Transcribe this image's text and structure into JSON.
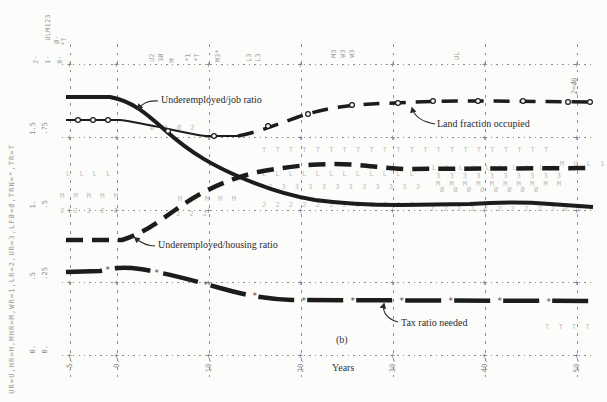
{
  "figure": {
    "panel_label": "(b)",
    "x_axis_label": "Years",
    "corner_note": "2=46",
    "left_legend": "UR=U,HR=H,MHR=M,WR=1,LR=2,UR=3,LFØ=Ø,TRN=*,TR=T",
    "corner_scale_symbols": [
      {
        "text": "ULM123",
        "x": 44,
        "yb": 40
      },
      {
        "text": "Ø·",
        "x": 53,
        "yb": 44
      },
      {
        "text": "*T",
        "x": 60,
        "yb": 46
      }
    ],
    "corner_scale_values": [
      {
        "text": "2·",
        "x": 32,
        "yb": 64
      },
      {
        "text": "1·",
        "x": 44,
        "yb": 64
      },
      {
        "text": "8·",
        "x": 56,
        "yb": 64
      }
    ]
  },
  "labels": {
    "underemployed_job_ratio": "Underemployed/job ratio",
    "land_fraction_occupied": "Land fraction occupied",
    "underemployed_housing_ratio": "Underemployed/housing ratio",
    "tax_ratio_needed": "Tax ratio needed"
  },
  "axes": {
    "x_ticks": [
      {
        "label": "-5.",
        "x": 70
      },
      {
        "label": "0.",
        "x": 117
      },
      {
        "label": "10.",
        "x": 209
      },
      {
        "label": "20.",
        "x": 301
      },
      {
        "label": "30.",
        "x": 393
      },
      {
        "label": "40.",
        "x": 485
      },
      {
        "label": "50.",
        "x": 577
      }
    ],
    "y_ticks": [
      {
        "scale1": "1.5",
        "scale2": ".75",
        "y": 138
      },
      {
        "scale1": "1.",
        "scale2": ".5",
        "y": 211
      },
      {
        "scale1": ".5",
        "scale2": ".25",
        "y": 283
      },
      {
        "scale1": "0.",
        "scale2": "0.",
        "y": 356
      }
    ],
    "grid_x": [
      70,
      117,
      209,
      301,
      393,
      485,
      577
    ],
    "grid_y": [
      65,
      138,
      211,
      283,
      356
    ]
  },
  "margin_notes": [
    {
      "text": "U2",
      "x": 148,
      "yb": 62
    },
    {
      "text": "3Ø",
      "x": 157,
      "yb": 62
    },
    {
      "text": "M",
      "x": 168,
      "yb": 62
    },
    {
      "text": "*1",
      "x": 184,
      "yb": 62
    },
    {
      "text": "*T",
      "x": 193,
      "yb": 62
    },
    {
      "text": "M3*",
      "x": 214,
      "yb": 62
    },
    {
      "text": "L3",
      "x": 245,
      "yb": 62
    },
    {
      "text": "L3",
      "x": 254,
      "yb": 62
    },
    {
      "text": "M3",
      "x": 330,
      "yb": 58
    },
    {
      "text": "W3",
      "x": 339,
      "yb": 58
    },
    {
      "text": "W3",
      "x": 348,
      "yb": 58
    },
    {
      "text": "UL",
      "x": 453,
      "yb": 60
    }
  ],
  "plot_symbols": {
    "letter_rows": [
      {
        "text": "L L L L",
        "x": 66,
        "y": 174
      },
      {
        "text": "M M M M M",
        "x": 60,
        "y": 196
      },
      {
        "text": "2 2 2 2 2",
        "x": 60,
        "y": 211
      },
      {
        "text": "M M M M M",
        "x": 178,
        "y": 199
      },
      {
        "text": "2 2 2",
        "x": 176,
        "y": 214
      },
      {
        "text": "Ø 2 Ø 2",
        "x": 150,
        "y": 128
      },
      {
        "text": "T T T T T T T T T T T T T T T T T T T T T T",
        "x": 262,
        "y": 150
      },
      {
        "text": "L L L L L L L L L L L L",
        "x": 262,
        "y": 174
      },
      {
        "text": "3 3 3 3 3 3 3 3 3 3 3 3",
        "x": 268,
        "y": 187
      },
      {
        "text": "2 2 2 2 2 2 2 2 2 2 2 2",
        "x": 262,
        "y": 205
      },
      {
        "text": "L L L L L L L L L L",
        "x": 432,
        "y": 168
      },
      {
        "text": "3 3 3 3 3 3 3 3 3 3",
        "x": 436,
        "y": 176
      },
      {
        "text": "M M M M M M M M M M",
        "x": 436,
        "y": 184
      },
      {
        "text": "Ø Ø Ø Ø Ø Ø Ø Ø",
        "x": 440,
        "y": 190
      },
      {
        "text": "2 2 2 2 2 2 2 2 2 2 2 2",
        "x": 430,
        "y": 209
      },
      {
        "text": "M U L 1",
        "x": 560,
        "y": 164
      },
      {
        "text": "* 2 *",
        "x": 562,
        "y": 210
      },
      {
        "text": "T T T T",
        "x": 545,
        "y": 327
      }
    ],
    "star_glyph": "*",
    "star_positions": [
      [
        108,
        269
      ],
      [
        157,
        272
      ],
      [
        206,
        284
      ],
      [
        255,
        295
      ],
      [
        304,
        300
      ],
      [
        353,
        300
      ],
      [
        402,
        300
      ],
      [
        451,
        300
      ],
      [
        500,
        300
      ],
      [
        549,
        301
      ]
    ],
    "circle_positions": [
      [
        78,
        120
      ],
      [
        93,
        120
      ],
      [
        108,
        120
      ],
      [
        168,
        131
      ],
      [
        214,
        136
      ],
      [
        268,
        126
      ],
      [
        308,
        114
      ],
      [
        352,
        105
      ],
      [
        398,
        103
      ],
      [
        433,
        101
      ],
      [
        478,
        101
      ],
      [
        523,
        101
      ],
      [
        568,
        102
      ],
      [
        590,
        102
      ]
    ]
  },
  "colors": {
    "curve": "#1c1c1c",
    "faint_letters": "#bcbcbc",
    "grid": "#909090",
    "label": "#2b2b2b",
    "tick": "#8c8c8c",
    "background": "#fcfcfb"
  },
  "chart_data": {
    "type": "line",
    "xlabel": "Years",
    "panel": "(b)",
    "x_range": [
      -5,
      50
    ],
    "grid": true,
    "scales": [
      {
        "symbols": "U,L,M,1,2,3",
        "range": [
          0,
          2
        ],
        "ticks": [
          0,
          0.5,
          1.0,
          1.5,
          2.0
        ]
      },
      {
        "symbols": "Ø,*,T",
        "range": [
          0,
          1
        ],
        "ticks": [
          0,
          0.25,
          0.5,
          0.75,
          1.0
        ]
      }
    ],
    "x": [
      -5,
      0,
      5,
      10,
      15,
      20,
      25,
      30,
      35,
      40,
      45,
      50
    ],
    "series": [
      {
        "name": "Underemployed/job ratio",
        "symbol": "U",
        "scale_range": [
          0,
          2
        ],
        "style": "heavy-solid",
        "values": [
          1.78,
          1.78,
          1.56,
          1.38,
          1.21,
          1.1,
          1.06,
          1.04,
          1.04,
          1.05,
          1.04,
          1.02
        ]
      },
      {
        "name": "Underemployed/housing ratio",
        "symbol": "2",
        "scale_range": [
          0,
          2
        ],
        "style": "heavy-dash",
        "values": [
          0.8,
          0.8,
          0.92,
          1.1,
          1.22,
          1.3,
          1.34,
          1.33,
          1.31,
          1.29,
          1.29,
          1.29
        ]
      },
      {
        "name": "Land fraction occupied",
        "symbol": "Ø",
        "scale_range": [
          0,
          1
        ],
        "style": "dash-with-circles",
        "values": [
          0.81,
          0.81,
          0.79,
          0.76,
          0.78,
          0.82,
          0.85,
          0.86,
          0.87,
          0.87,
          0.87,
          0.87
        ]
      },
      {
        "name": "Tax ratio needed",
        "symbol": "*",
        "scale_range": [
          0,
          1
        ],
        "style": "long-dash-with-stars",
        "values": [
          0.29,
          0.3,
          0.28,
          0.25,
          0.22,
          0.2,
          0.19,
          0.19,
          0.19,
          0.19,
          0.19,
          0.19
        ]
      }
    ]
  }
}
